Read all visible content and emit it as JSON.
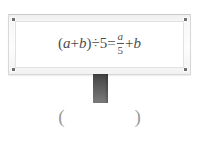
{
  "page": {
    "background_color": "#ffffff",
    "width": 199,
    "height": 141
  },
  "signboard": {
    "frame_color": "#f2f2f2",
    "panel_color": "#ffffff",
    "bolt_color": "#6f6f6f",
    "bolts": [
      "top-left",
      "top-right",
      "bottom-left",
      "bottom-right"
    ]
  },
  "equation": {
    "full_text": "(a+b)÷5=a/5+b",
    "text_color": "#4d4d4d",
    "lhs_open_paren": "(",
    "lhs_var_a": "a",
    "lhs_plus": "+",
    "lhs_var_b": "b",
    "lhs_close_paren": ")",
    "divide_sign": "÷",
    "divisor": "5",
    "equals_sign": "=",
    "fraction_numerator": "a",
    "fraction_denominator": "5",
    "rhs_plus": "+",
    "rhs_var_b": "b"
  },
  "post": {
    "color": "#555555"
  },
  "answer_blank": {
    "open_paren": "(",
    "close_paren": ")",
    "value": "",
    "color": "#9a9a9a"
  }
}
